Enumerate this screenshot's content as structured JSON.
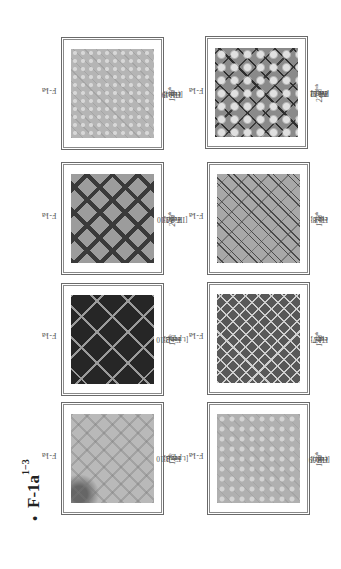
{
  "page": {
    "orientation": "rotated-90-ccw",
    "heading": {
      "bullet": "•",
      "text": "F-1a",
      "superscript": "1−3"
    }
  },
  "figures": [
    {
      "id": "fig1",
      "label": "F-1a",
      "label_sup": "1",
      "caption_prefix": "Fig.1: ",
      "caption_num": "12",
      "caption_rest": " [t.pq. B.10",
      "caption_sup": "th",
      "caption_end": " cent.]",
      "pattern": "light-grey-scale-lattice"
    },
    {
      "id": "fig2",
      "label": "F-1a",
      "label_sup": "1",
      "caption_prefix": "Fig.2: ",
      "caption_num": "14",
      "caption_rest": " [t.pq. B.10",
      "caption_sup": "th",
      "caption_end": " cent.]",
      "pattern": "dark-diamond-medallions"
    },
    {
      "id": "fig3",
      "label": "F-1a",
      "label_sup": "1",
      "caption_prefix": "Fig.3: ",
      "caption_num": "269",
      "caption_rest": " [IH./M.10",
      "caption_sup": "th",
      "caption_end": " cent.]",
      "pattern": "dark-lattice-diamonds"
    },
    {
      "id": "fig4",
      "label": "F-1a",
      "label_sup": "2",
      "caption_prefix": "Fig.4: ",
      "caption_num": "179",
      "caption_rest": " [(IH.)9",
      "caption_sup": "th",
      "caption_end": " cent.]",
      "pattern": "fine-grey-dot-lattice"
    },
    {
      "id": "fig6",
      "label": "F-1a",
      "label_sup": "2",
      "caption_prefix": "Fig.6: ",
      "caption_num": "169",
      "caption_rest": " [(IH.)9",
      "caption_sup": "th",
      "caption_end": " cent.]",
      "pattern": "grey-dot-lattice"
    },
    {
      "id": "fig7",
      "label": "F-1a",
      "label_sup": "3",
      "caption_prefix": "Fig.7: ",
      "caption_num": "142",
      "caption_rest": " [13",
      "caption_sup": "th",
      "caption_end": " cent.]",
      "pattern": "dark-octagon-lattice"
    },
    {
      "id": "fig8",
      "label": "F-1a",
      "label_sup": "3",
      "caption_prefix": "Fig.8: ",
      "caption_num": "122",
      "caption_rest": " [13",
      "caption_sup": "th",
      "caption_end": " cent.]",
      "pattern": "double-line-lattice-stars"
    },
    {
      "id": "fig9",
      "label": "F-1a",
      "label_sup": "3",
      "caption_prefix": "Fig.9: ",
      "caption_num": "225",
      "caption_rest": " [IH.11",
      "caption_sup": "th",
      "caption_end": "/M.12",
      "caption_sup2": "th",
      "caption_end2": " cent.]",
      "pattern": "floral-lattice"
    }
  ]
}
